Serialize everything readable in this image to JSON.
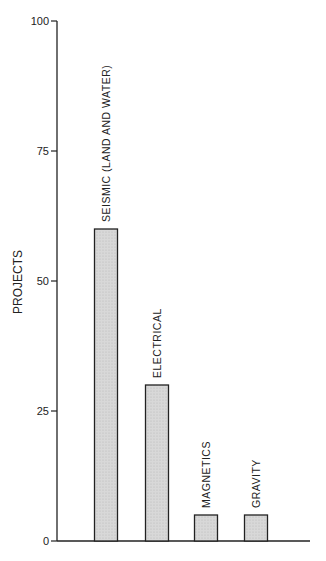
{
  "chart_data": {
    "type": "bar",
    "title": "",
    "xlabel": "",
    "ylabel": "PROJECTS",
    "ylim": [
      0,
      100
    ],
    "yticks": [
      0,
      25,
      50,
      75,
      100
    ],
    "grid": false,
    "legend": null,
    "categories": [
      "SEISMIC (LAND AND WATER)",
      "ELECTRICAL",
      "MAGNETICS",
      "GRAVITY"
    ],
    "values": [
      60,
      30,
      5,
      5
    ],
    "bar_color": "#d4d4d4",
    "bar_edge_color": "#222222"
  }
}
